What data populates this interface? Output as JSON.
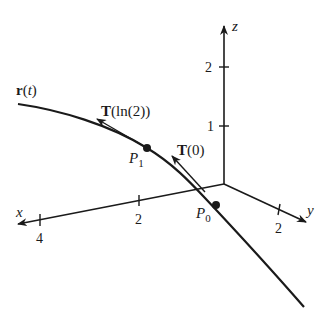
{
  "figure": {
    "axes": {
      "x": {
        "label": "x",
        "ticks": [
          {
            "value": 2,
            "label": "2"
          },
          {
            "value": 4,
            "label": "4"
          }
        ]
      },
      "y": {
        "label": "y",
        "ticks": [
          {
            "value": 2,
            "label": "2"
          }
        ]
      },
      "z": {
        "label": "z",
        "ticks": [
          {
            "value": 1,
            "label": "1"
          },
          {
            "value": 2,
            "label": "2"
          }
        ]
      }
    },
    "curve": {
      "label_main": "r",
      "label_arg": "(t)",
      "label_var": "t"
    },
    "points": [
      {
        "id": "P0",
        "label": "P",
        "subscript": "0"
      },
      {
        "id": "P1",
        "label": "P",
        "subscript": "1"
      }
    ],
    "tangent_vectors": [
      {
        "id": "T0",
        "label_bold": "T",
        "label_arg": "(0)"
      },
      {
        "id": "Tln2",
        "label_bold": "T",
        "label_arg": "(ln(2))"
      }
    ]
  }
}
